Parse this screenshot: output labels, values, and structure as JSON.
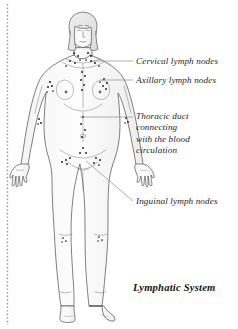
{
  "figure": {
    "title": "Lymphatic System",
    "background_color": "#ffffff",
    "line_color": "#3a3a3a",
    "node_color": "#1a1a1a",
    "leader_color": "#8c8c8c",
    "shade_color": "#e8e8e8",
    "margin_rule_color": "#9a9a9a"
  },
  "labels": [
    {
      "id": "cervical",
      "text": "Cervical lymph nodes",
      "x": 136,
      "y": 56,
      "leader": {
        "x1": 92,
        "y1": 61,
        "x2": 133,
        "y2": 61
      }
    },
    {
      "id": "axillary",
      "text": "Axillary lymph nodes",
      "x": 136,
      "y": 75,
      "leader": {
        "x1": 101,
        "y1": 80,
        "x2": 133,
        "y2": 80
      }
    },
    {
      "id": "thoracic-duct",
      "lines": [
        "Thoracic duct",
        "connecting",
        "with the blood",
        "circulation"
      ],
      "x": 136,
      "y": 112,
      "leader": {
        "x1": 80,
        "y1": 117,
        "x2": 133,
        "y2": 117
      }
    },
    {
      "id": "inguinal",
      "text": "Inguinal lymph nodes",
      "x": 136,
      "y": 196,
      "leader": {
        "x1": 86,
        "y1": 161,
        "x2": 133,
        "y2": 201
      }
    }
  ],
  "node_groups": [
    {
      "name": "cervical-nodes",
      "count": 12
    },
    {
      "name": "axillary-nodes",
      "count": 10
    },
    {
      "name": "thoracic-duct-nodes",
      "count": 9
    },
    {
      "name": "elbow-nodes",
      "count": 6
    },
    {
      "name": "inguinal-nodes",
      "count": 11
    },
    {
      "name": "popliteal-nodes",
      "count": 6
    }
  ]
}
